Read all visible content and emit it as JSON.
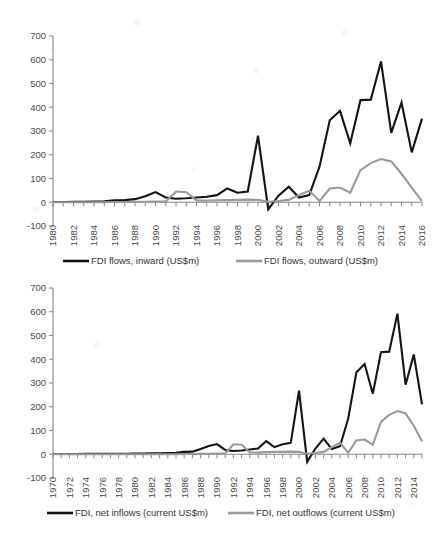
{
  "figure": {
    "background_color": "#ffffff",
    "inward_color": "#141414",
    "outward_color": "#9a9a9a",
    "axis_color": "#868686",
    "text_color": "#4a4a4a"
  },
  "chart_data": [
    {
      "id": "top",
      "type": "line",
      "title": "",
      "xlabel": "",
      "ylabel": "",
      "ylim": [
        -100,
        700
      ],
      "ytick_labels": [
        "700",
        "600",
        "500",
        "400",
        "300",
        "200",
        "100",
        "0",
        "-100"
      ],
      "ytick_values": [
        700,
        600,
        500,
        400,
        300,
        200,
        100,
        0,
        -100
      ],
      "xlim": [
        1980,
        2016
      ],
      "xtick_labels": [
        "1980",
        "1982",
        "1984",
        "1986",
        "1988",
        "1990",
        "1992",
        "1994",
        "1996",
        "1998",
        "2000",
        "2002",
        "2004",
        "2006",
        "2008",
        "2010",
        "2012",
        "2014",
        "2016"
      ],
      "grid": false,
      "legend_position": "bottom",
      "x": [
        1980,
        1981,
        1982,
        1983,
        1984,
        1985,
        1986,
        1987,
        1988,
        1989,
        1990,
        1991,
        1992,
        1993,
        1994,
        1995,
        1996,
        1997,
        1998,
        1999,
        2000,
        2001,
        2002,
        2003,
        2004,
        2005,
        2006,
        2007,
        2008,
        2009,
        2010,
        2011,
        2012,
        2013,
        2014,
        2015,
        2016
      ],
      "series": [
        {
          "name": "FDI flows, inward (US$m)",
          "color": "#141414",
          "values": [
            1,
            1,
            2,
            2,
            3,
            4,
            8,
            9,
            13,
            25,
            43,
            20,
            15,
            17,
            20,
            23,
            30,
            58,
            40,
            45,
            280,
            -30,
            28,
            65,
            20,
            30,
            150,
            345,
            385,
            248,
            430,
            432,
            593,
            292,
            420,
            210,
            352
          ]
        },
        {
          "name": "FDI flows, outward (US$m)",
          "color": "#9a9a9a",
          "values": [
            0,
            0,
            0,
            0,
            0,
            0,
            1,
            1,
            2,
            2,
            3,
            3,
            45,
            42,
            8,
            7,
            8,
            9,
            10,
            11,
            10,
            2,
            5,
            10,
            30,
            48,
            5,
            58,
            62,
            40,
            135,
            165,
            182,
            172,
            120,
            62,
            5
          ]
        }
      ],
      "legend": [
        {
          "label": "FDI flows, inward (US$m)",
          "color": "#141414"
        },
        {
          "label": "FDI flows, outward (US$m)",
          "color": "#9a9a9a"
        }
      ]
    },
    {
      "id": "bottom",
      "type": "line",
      "title": "",
      "xlabel": "",
      "ylabel": "",
      "ylim": [
        -100,
        700
      ],
      "ytick_labels": [
        "700",
        "600",
        "500",
        "400",
        "300",
        "200",
        "100",
        "0",
        "-100"
      ],
      "ytick_values": [
        700,
        600,
        500,
        400,
        300,
        200,
        100,
        0,
        -100
      ],
      "xlim": [
        1970,
        2015
      ],
      "xtick_labels": [
        "1970",
        "1972",
        "1974",
        "1976",
        "1978",
        "1980",
        "1982",
        "1984",
        "1986",
        "1988",
        "1990",
        "1992",
        "1994",
        "1996",
        "1998",
        "2000",
        "2002",
        "2004",
        "2006",
        "2008",
        "2010",
        "2012",
        "2014"
      ],
      "grid": false,
      "legend_position": "bottom",
      "x": [
        1970,
        1971,
        1972,
        1973,
        1974,
        1975,
        1976,
        1977,
        1978,
        1979,
        1980,
        1981,
        1982,
        1983,
        1984,
        1985,
        1986,
        1987,
        1988,
        1989,
        1990,
        1991,
        1992,
        1993,
        1994,
        1995,
        1996,
        1997,
        1998,
        1999,
        2000,
        2001,
        2002,
        2003,
        2004,
        2005,
        2006,
        2007,
        2008,
        2009,
        2010,
        2011,
        2012,
        2013,
        2014,
        2015
      ],
      "series": [
        {
          "name": "FDI, net inflows (current US$m)",
          "color": "#141414",
          "values": [
            1,
            1,
            1,
            1,
            2,
            2,
            2,
            2,
            2,
            2,
            3,
            3,
            4,
            4,
            5,
            6,
            10,
            11,
            22,
            35,
            43,
            18,
            14,
            16,
            20,
            24,
            55,
            30,
            42,
            48,
            268,
            -32,
            24,
            66,
            22,
            34,
            150,
            345,
            380,
            255,
            430,
            432,
            592,
            293,
            420,
            210
          ]
        },
        {
          "name": "FDI, net outflows (current US$m)",
          "color": "#9a9a9a",
          "values": [
            0,
            0,
            0,
            0,
            0,
            0,
            0,
            0,
            0,
            0,
            0,
            0,
            0,
            0,
            0,
            0,
            1,
            1,
            2,
            2,
            3,
            3,
            42,
            40,
            8,
            7,
            9,
            10,
            10,
            11,
            10,
            2,
            5,
            10,
            30,
            48,
            6,
            58,
            62,
            40,
            136,
            166,
            182,
            172,
            120,
            55
          ]
        }
      ],
      "legend": [
        {
          "label": "FDI, net inflows (current US$m)",
          "color": "#141414"
        },
        {
          "label": "FDI, net outflows (current US$m)",
          "color": "#9a9a9a"
        }
      ]
    }
  ]
}
